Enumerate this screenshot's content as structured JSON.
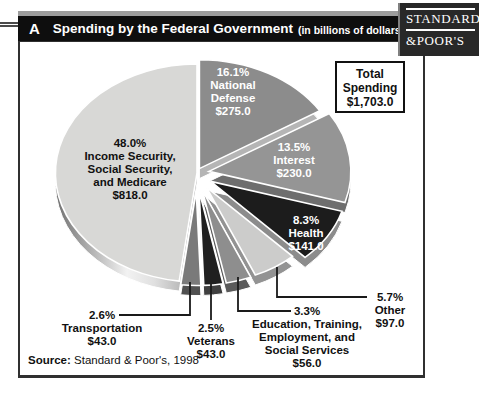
{
  "header": {
    "panel_label": "A",
    "title": "Spending by the Federal Government",
    "subtitle": "(in billions of dollars)"
  },
  "brand": {
    "name": "Standard & Poor's",
    "line1": "STANDARD",
    "line2": "&POOR'S"
  },
  "total_box": {
    "lines": [
      "Total",
      "Spending",
      "$1,703.0"
    ]
  },
  "source": {
    "label": "Source:",
    "text": " Standard & Poor's, 1998"
  },
  "chart_data": {
    "type": "pie",
    "title": "Spending by the Federal Government",
    "units": "billions of dollars",
    "total": 1703.0,
    "total_label": "Total Spending $1,703.0",
    "legend_position": "labels-on-slices",
    "slices": [
      {
        "name": "National Defense",
        "pct": 16.1,
        "value": 275.0,
        "color": "#8c8c8c",
        "side_color": "#b5b5b5",
        "text_color": "#ffffff",
        "label_lines": [
          "16.1%",
          "National",
          "Defense",
          "$275.0"
        ]
      },
      {
        "name": "Interest",
        "pct": 13.5,
        "value": 230.0,
        "color": "#959595",
        "side_color": "#6e6e6e",
        "text_color": "#ffffff",
        "label_lines": [
          "13.5%",
          "Interest",
          "$230.0"
        ]
      },
      {
        "name": "Health",
        "pct": 8.3,
        "value": 141.0,
        "color": "#1c1c1c",
        "side_color": "#8c8c8c",
        "text_color": "#ffffff",
        "label_lines": [
          "8.3%",
          "Health",
          "$141.0"
        ]
      },
      {
        "name": "Other",
        "pct": 5.7,
        "value": 97.0,
        "color": "#cccccb",
        "side_color": "#939393",
        "text_color": "#111111",
        "label_lines": [
          "5.7%",
          "Other",
          "$97.0"
        ]
      },
      {
        "name": "Education, Training, Employment, and Social Services",
        "pct": 3.3,
        "value": 56.0,
        "color": "#8e8e8e",
        "side_color": "#5a5a5a",
        "text_color": "#111111",
        "label_lines": [
          "3.3%",
          "Education, Training,",
          "Employment, and",
          "Social Services",
          "$56.0"
        ]
      },
      {
        "name": "Veterans",
        "pct": 2.5,
        "value": 43.0,
        "color": "#202020",
        "side_color": "#3f3f3f",
        "text_color": "#111111",
        "label_lines": [
          "2.5%",
          "Veterans",
          "$43.0"
        ]
      },
      {
        "name": "Transportation",
        "pct": 2.6,
        "value": 43.0,
        "color": "#7a7a7a",
        "side_color": "#505050",
        "text_color": "#111111",
        "label_lines": [
          "2.6%",
          "Transportation",
          "$43.0"
        ]
      },
      {
        "name": "Income Security, Social Security, and Medicare",
        "pct": 48.0,
        "value": 818.0,
        "color": "#d8d8d6",
        "side_color": "#ababab",
        "text_color": "#111111",
        "label_lines": [
          "48.0%",
          "Income Security,",
          "Social Security,",
          "and Medicare",
          "$818.0"
        ]
      }
    ]
  }
}
